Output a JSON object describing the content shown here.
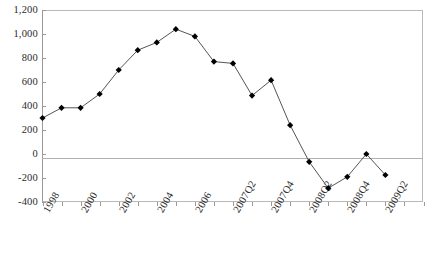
{
  "chart_data": {
    "type": "line",
    "title": "",
    "xlabel": "",
    "ylabel": "",
    "ylim": [
      -400,
      1200
    ],
    "ytick_step": 200,
    "grid": false,
    "legend": "none",
    "marker": "diamond",
    "marker_color": "#000000",
    "line_color": "#555555",
    "zero_line": true,
    "categories": [
      "1998",
      "1999",
      "2000",
      "2001",
      "2002",
      "2003",
      "2004",
      "2005",
      "2006",
      "2007Q1",
      "2007Q2",
      "2007Q3",
      "2007Q4",
      "2008Q1",
      "2008Q2",
      "2008Q3",
      "2008Q4",
      "2009Q1",
      "2009Q2",
      "2009Q3",
      "2009Q4"
    ],
    "tick_labels": [
      "1998",
      "",
      "2000",
      "",
      "2002",
      "",
      "2004",
      "",
      "2006",
      "",
      "2007Q2",
      "",
      "2007Q4",
      "",
      "2008Q2",
      "",
      "2008Q4",
      "",
      "2009Q2",
      "",
      ""
    ],
    "values": [
      300,
      385,
      385,
      500,
      700,
      865,
      930,
      1040,
      980,
      770,
      755,
      487,
      615,
      240,
      -65,
      -285,
      -190,
      0,
      -175,
      null,
      null
    ],
    "ytick_labels": [
      "1,200",
      "1,000",
      "800",
      "600",
      "400",
      "200",
      "0",
      "-200",
      "-400"
    ],
    "ytick_values": [
      1200,
      1000,
      800,
      600,
      400,
      200,
      0,
      -200,
      -400
    ]
  }
}
